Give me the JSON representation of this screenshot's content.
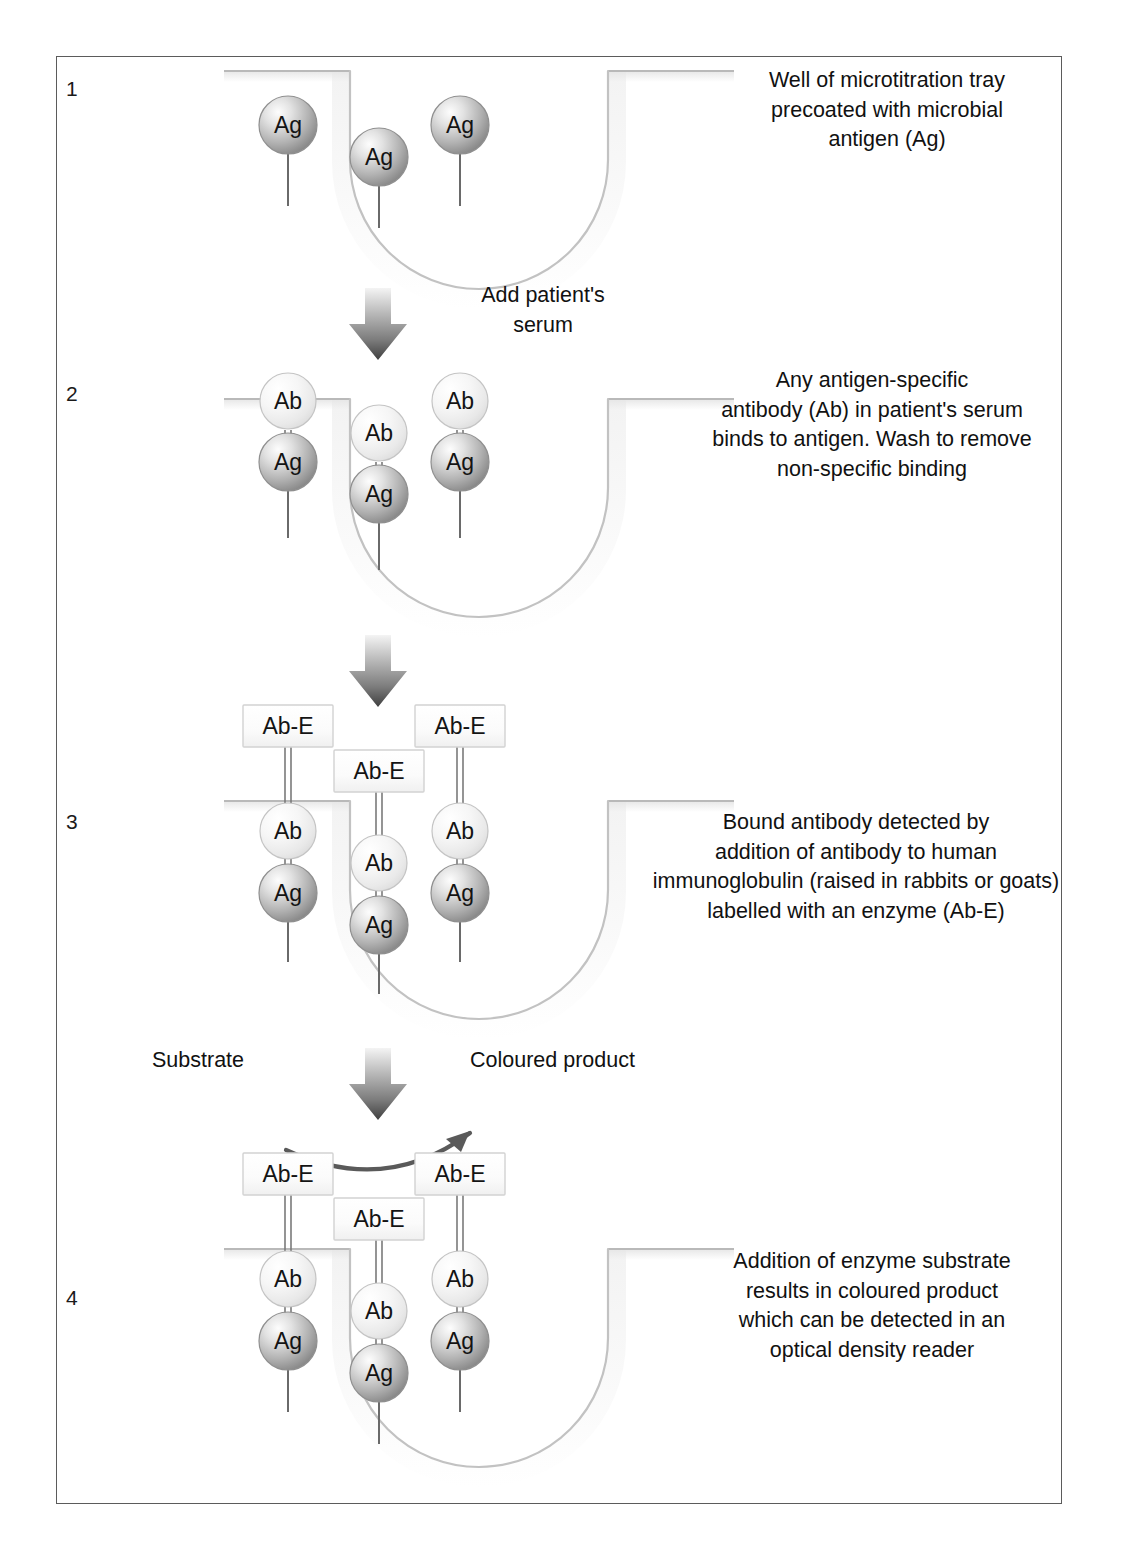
{
  "diagram": {
    "colors": {
      "border": "#5b5b5b",
      "text": "#111111",
      "ag_fill_light": "#f2f2f2",
      "ag_fill_dark": "#8d8d8d",
      "ab_fill_light": "#fcfcfc",
      "ab_fill_dark": "#d8d8d8",
      "abe_fill": "#fbfbfb",
      "abe_border": "#cfcfcf",
      "well_line": "#bdbdbd",
      "connector": "#6a6a6a",
      "arrow_dark": "#4a4a4a",
      "arrow_light": "#e8e8e8"
    },
    "steps": [
      {
        "number": "1",
        "caption": "Well of microtitration tray\nprecoated with microbial\nantigen (Ag)",
        "molecules": [
          "Ag",
          "Ag",
          "Ag"
        ]
      },
      {
        "number": "2",
        "caption": "Any antigen-specific\nantibody (Ab) in patient's serum\nbinds to antigen. Wash to remove\nnon-specific binding",
        "molecules": [
          "Ag",
          "Ab"
        ]
      },
      {
        "number": "3",
        "caption": "Bound antibody detected by\naddition of antibody to human\nimmunoglobulin (raised in rabbits or goats)\nlabelled with an enzyme (Ab-E)",
        "molecules": [
          "Ag",
          "Ab",
          "Ab-E"
        ]
      },
      {
        "number": "4",
        "caption": "Addition of enzyme substrate\nresults in coloured product\nwhich can be detected in an\noptical density reader",
        "molecules": [
          "Ag",
          "Ab",
          "Ab-E"
        ]
      }
    ],
    "arrows": [
      {
        "id": "arrow-1-2",
        "label": "Add patient's\nserum"
      },
      {
        "id": "arrow-2-3",
        "label": ""
      },
      {
        "id": "arrow-3-4",
        "label": ""
      }
    ],
    "reaction": {
      "substrate_label": "Substrate",
      "product_label": "Coloured product",
      "curved_arrow": "curved-reaction-arrow"
    },
    "labels": {
      "ag": "Ag",
      "ab": "Ab",
      "abe": "Ab-E"
    }
  }
}
